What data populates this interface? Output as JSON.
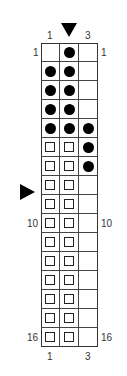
{
  "chart": {
    "columns": 3,
    "rows": 16,
    "top_col_labels": [
      {
        "col": 1,
        "text": "1"
      },
      {
        "col": 3,
        "text": "3"
      }
    ],
    "bottom_col_labels": [
      {
        "col": 1,
        "text": "1"
      },
      {
        "col": 3,
        "text": "3"
      }
    ],
    "left_row_labels": [
      {
        "row": 1,
        "text": "1"
      },
      {
        "row": 10,
        "text": "10"
      },
      {
        "row": 16,
        "text": "16"
      }
    ],
    "right_row_labels": [
      {
        "row": 1,
        "text": "1"
      },
      {
        "row": 10,
        "text": "10"
      },
      {
        "row": 16,
        "text": "16"
      }
    ],
    "column_marker": {
      "col": 2,
      "symbol": "down-triangle"
    },
    "row_marker": {
      "row": 9,
      "symbol": "right-triangle"
    },
    "cells": [
      [
        "empty",
        "dot",
        "empty"
      ],
      [
        "dot",
        "dot",
        "empty"
      ],
      [
        "dot",
        "dot",
        "empty"
      ],
      [
        "dot",
        "dot",
        "empty"
      ],
      [
        "dot",
        "dot",
        "dot"
      ],
      [
        "square",
        "square",
        "dot"
      ],
      [
        "square",
        "square",
        "dot"
      ],
      [
        "square",
        "square",
        "empty"
      ],
      [
        "square",
        "square",
        "empty"
      ],
      [
        "square",
        "square",
        "empty"
      ],
      [
        "square",
        "square",
        "empty"
      ],
      [
        "square",
        "square",
        "empty"
      ],
      [
        "square",
        "square",
        "empty"
      ],
      [
        "square",
        "square",
        "empty"
      ],
      [
        "square",
        "square",
        "empty"
      ],
      [
        "square",
        "square",
        "empty"
      ]
    ],
    "legend_symbols": {
      "dot": "filled-circle",
      "square": "hollow-square",
      "empty": "blank"
    }
  }
}
